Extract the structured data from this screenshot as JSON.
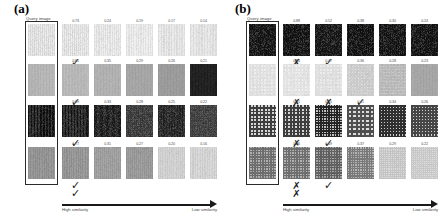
{
  "figure": {
    "panels": [
      {
        "id": "a",
        "label": "(a)",
        "query_caption": "Query image",
        "axis": {
          "left_label": "High similarity",
          "right_label": "Low similarity"
        },
        "rows": [
          {
            "query": {
              "base": "#ededed",
              "stripe": "#dcdcdc",
              "stripe_w": 2.0,
              "noise": 0.1,
              "grid": false
            },
            "results": [
              {
                "score": "0.73",
                "base": "#eeeeee",
                "stripe": "#dedede",
                "stripe_w": 2.0,
                "noise": 0.1,
                "grid": false,
                "mark": "check"
              },
              {
                "score": "0.24",
                "base": "#f0f0f0",
                "stripe": "#e2e2e2",
                "stripe_w": 2.2,
                "noise": 0.09,
                "grid": false,
                "mark": null
              },
              {
                "score": "0.19",
                "base": "#f1f1f1",
                "stripe": "#e5e5e5",
                "stripe_w": 2.4,
                "noise": 0.08,
                "grid": false,
                "mark": null
              },
              {
                "score": "0.17",
                "base": "#ececec",
                "stripe": "#e0e0e0",
                "stripe_w": 2.6,
                "noise": 0.08,
                "grid": false,
                "mark": null
              },
              {
                "score": "0.14",
                "base": "#ebebeb",
                "stripe": "#dfdfdf",
                "stripe_w": 2.8,
                "noise": 0.08,
                "grid": false,
                "mark": null
              }
            ]
          },
          {
            "query": {
              "base": "#b9b9b9",
              "stripe": "#b2b2b2",
              "stripe_w": 3.0,
              "noise": 0.05,
              "grid": false
            },
            "results": [
              {
                "score": "0.81",
                "base": "#bdbdbd",
                "stripe": "#b6b6b6",
                "stripe_w": 3.0,
                "noise": 0.05,
                "grid": false,
                "mark": "check"
              },
              {
                "score": "0.35",
                "base": "#b4b4b4",
                "stripe": "#adadad",
                "stripe_w": 3.0,
                "noise": 0.05,
                "grid": false,
                "mark": null
              },
              {
                "score": "0.29",
                "base": "#a8a8a8",
                "stripe": "#a2a2a2",
                "stripe_w": 3.0,
                "noise": 0.05,
                "grid": false,
                "mark": null
              },
              {
                "score": "0.26",
                "base": "#9e9e9e",
                "stripe": "#989898",
                "stripe_w": 3.0,
                "noise": 0.05,
                "grid": false,
                "mark": null
              },
              {
                "score": "0.21",
                "base": "#1c1c1c",
                "stripe": "#222222",
                "stripe_w": 3.0,
                "noise": 0.06,
                "grid": false,
                "mark": null
              }
            ]
          },
          {
            "query": {
              "base": "#2f2f2f",
              "stripe": "#0d0d0d",
              "stripe_w": 1.5,
              "noise": 0.18,
              "grid": false
            },
            "results": [
              {
                "score": "0.69",
                "base": "#313131",
                "stripe": "#101010",
                "stripe_w": 1.5,
                "noise": 0.18,
                "grid": false,
                "mark": "check"
              },
              {
                "score": "0.33",
                "base": "#2a2a2a",
                "stripe": "#1a1a1a",
                "stripe_w": 1.2,
                "noise": 0.22,
                "grid": false,
                "mark": null
              },
              {
                "score": "0.28",
                "base": "#4a4a4a",
                "stripe": "#3a3a3a",
                "stripe_w": 2.0,
                "noise": 0.2,
                "grid": true,
                "mark": null
              },
              {
                "score": "0.25",
                "base": "#303030",
                "stripe": "#202020",
                "stripe_w": 1.6,
                "noise": 0.22,
                "grid": false,
                "mark": null
              },
              {
                "score": "0.22",
                "base": "#4f4f4f",
                "stripe": "#3f3f3f",
                "stripe_w": 2.2,
                "noise": 0.18,
                "grid": true,
                "mark": null
              }
            ]
          },
          {
            "query": {
              "base": "#9a9a9a",
              "stripe": "#8e8e8e",
              "stripe_w": 1.8,
              "noise": 0.08,
              "grid": false
            },
            "results": [
              {
                "score": "0.77",
                "base": "#9c9c9c",
                "stripe": "#909090",
                "stripe_w": 1.8,
                "noise": 0.08,
                "grid": false,
                "mark": "check"
              },
              {
                "score": "0.31",
                "base": "#a5a5a5",
                "stripe": "#9a9a9a",
                "stripe_w": 2.0,
                "noise": 0.08,
                "grid": false,
                "mark": null
              },
              {
                "score": "0.27",
                "base": "#a0a0a0",
                "stripe": "#959595",
                "stripe_w": 2.0,
                "noise": 0.08,
                "grid": false,
                "mark": null
              },
              {
                "score": "0.20",
                "base": "#d6d6d6",
                "stripe": "#cccccc",
                "stripe_w": 2.2,
                "noise": 0.07,
                "grid": false,
                "mark": null
              },
              {
                "score": "0.16",
                "base": "#dadada",
                "stripe": "#d0d0d0",
                "stripe_w": 2.4,
                "noise": 0.07,
                "grid": false,
                "mark": null
              }
            ]
          }
        ],
        "bottom_mark": "check"
      },
      {
        "id": "b",
        "label": "(b)",
        "query_caption": "Query image",
        "axis": {
          "left_label": "High similarity",
          "right_label": "Low similarity"
        },
        "rows": [
          {
            "query": {
              "base": "#121212",
              "stripe": "#1a1a1a",
              "stripe_w": 2.0,
              "noise": 0.25,
              "grid": false
            },
            "results": [
              {
                "score": "0.88",
                "base": "#101010",
                "stripe": "#181818",
                "stripe_w": 2.0,
                "noise": 0.25,
                "grid": false,
                "mark": "cross"
              },
              {
                "score": "0.52",
                "base": "#131313",
                "stripe": "#1b1b1b",
                "stripe_w": 2.0,
                "noise": 0.25,
                "grid": false,
                "mark": "check"
              },
              {
                "score": "0.38",
                "base": "#0f0f0f",
                "stripe": "#171717",
                "stripe_w": 2.0,
                "noise": 0.25,
                "grid": false,
                "mark": null
              },
              {
                "score": "0.30",
                "base": "#111111",
                "stripe": "#191919",
                "stripe_w": 2.0,
                "noise": 0.25,
                "grid": false,
                "mark": null
              },
              {
                "score": "0.24",
                "base": "#101010",
                "stripe": "#181818",
                "stripe_w": 2.0,
                "noise": 0.25,
                "grid": false,
                "mark": null
              }
            ]
          },
          {
            "query": {
              "base": "#efefef",
              "stripe": "#e2e2e2",
              "stripe_w": 3.4,
              "noise": 0.06,
              "grid": true
            },
            "results": [
              {
                "score": "0.84",
                "base": "#f0f0f0",
                "stripe": "#e4e4e4",
                "stripe_w": 3.4,
                "noise": 0.06,
                "grid": true,
                "mark": "cross"
              },
              {
                "score": "0.47",
                "base": "#ededed",
                "stripe": "#e0e0e0",
                "stripe_w": 3.4,
                "noise": 0.06,
                "grid": true,
                "mark": "cross"
              },
              {
                "score": "0.36",
                "base": "#dfdfdf",
                "stripe": "#cfcfcf",
                "stripe_w": 3.0,
                "noise": 0.08,
                "grid": true,
                "mark": "check"
              },
              {
                "score": "0.28",
                "base": "#c9c9c9",
                "stripe": "#bbbbbb",
                "stripe_w": 3.0,
                "noise": 0.08,
                "grid": true,
                "mark": null
              },
              {
                "score": "0.23",
                "base": "#a9a9a9",
                "stripe": "#a3a3a3",
                "stripe_w": 3.0,
                "noise": 0.05,
                "grid": false,
                "mark": null
              }
            ]
          },
          {
            "query": {
              "base": "#d8d8d8",
              "stripe": "#3c3c3c",
              "stripe_w": 1.4,
              "noise": 0.07,
              "grid": true
            },
            "results": [
              {
                "score": "0.91",
                "base": "#d8d8d8",
                "stripe": "#3c3c3c",
                "stripe_w": 1.4,
                "noise": 0.07,
                "grid": true,
                "mark": "cross"
              },
              {
                "score": "0.55",
                "base": "#c2c2c2",
                "stripe": "#222222",
                "stripe_w": 1.6,
                "noise": 0.08,
                "grid": true,
                "mark": "check"
              },
              {
                "score": "0.41",
                "base": "#dedede",
                "stripe": "#4e4e4e",
                "stripe_w": 1.3,
                "noise": 0.07,
                "grid": true,
                "mark": null
              },
              {
                "score": "0.34",
                "base": "#cfcfcf",
                "stripe": "#2e2e2e",
                "stripe_w": 1.5,
                "noise": 0.08,
                "grid": true,
                "mark": null
              },
              {
                "score": "0.26",
                "base": "#d5d5d5",
                "stripe": "#454545",
                "stripe_w": 1.5,
                "noise": 0.07,
                "grid": true,
                "mark": null
              }
            ]
          },
          {
            "query": {
              "base": "#b0b0b0",
              "stripe": "#6e6e6e",
              "stripe_w": 1.6,
              "noise": 0.06,
              "grid": true
            },
            "results": [
              {
                "score": "0.86",
                "base": "#b2b2b2",
                "stripe": "#707070",
                "stripe_w": 1.6,
                "noise": 0.06,
                "grid": true,
                "mark": "cross"
              },
              {
                "score": "0.49",
                "base": "#a6a6a6",
                "stripe": "#606060",
                "stripe_w": 1.6,
                "noise": 0.06,
                "grid": true,
                "mark": "check"
              },
              {
                "score": "0.37",
                "base": "#b6b6b6",
                "stripe": "#7a7a7a",
                "stripe_w": 1.7,
                "noise": 0.06,
                "grid": true,
                "mark": null
              },
              {
                "score": "0.29",
                "base": "#dcdcdc",
                "stripe": "#c6c6c6",
                "stripe_w": 1.9,
                "noise": 0.05,
                "grid": true,
                "mark": null
              },
              {
                "score": "0.22",
                "base": "#dedede",
                "stripe": "#cacaca",
                "stripe_w": 2.0,
                "noise": 0.05,
                "grid": true,
                "mark": null
              }
            ]
          }
        ],
        "bottom_mark": "cross"
      }
    ],
    "glyphs": {
      "check": "✓",
      "cross": "✗"
    }
  }
}
